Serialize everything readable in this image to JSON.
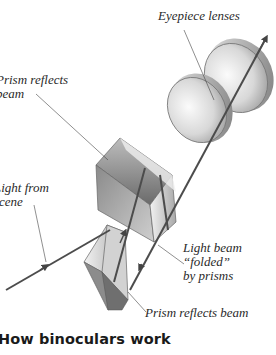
{
  "diagram": {
    "title": "How binoculars work",
    "labels": {
      "eyepiece": "Eyepiece lenses",
      "prism_top_l1": "Prism reflects",
      "prism_top_l2": "beam",
      "light_l1": "Light from",
      "light_l2": "scene",
      "folded_l1": "Light beam",
      "folded_l2": "“folded”",
      "folded_l3": "by prisms",
      "prism_bottom": "Prism reflects beam"
    },
    "components": [
      "eyepiece-lens-front",
      "eyepiece-lens-back",
      "upper-prism",
      "lower-prism",
      "light-beam"
    ],
    "colors": {
      "beam": "#555555",
      "lens_light": "#eeeeee",
      "lens_dark": "#9a9a9a",
      "prism_light": "#e6e6e6",
      "prism_dark": "#6e6e6e",
      "text": "#2a2a2a"
    }
  }
}
